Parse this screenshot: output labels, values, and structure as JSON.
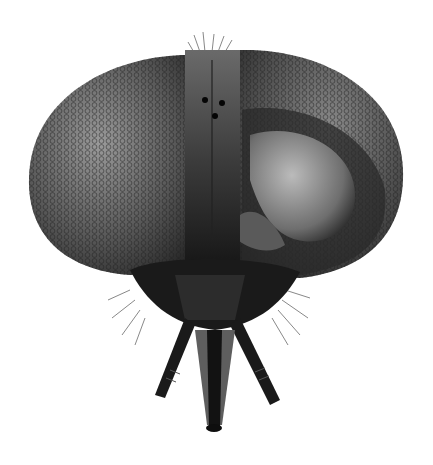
{
  "image": {
    "subject": "insect head (fly), frontal view",
    "style": "grayscale micrograph",
    "background_color": "#ffffff",
    "colors": {
      "eye_base": "#555555",
      "eye_highlight": "#9a9a9a",
      "frons": "#3a3a3a",
      "dark": "#141414"
    }
  }
}
